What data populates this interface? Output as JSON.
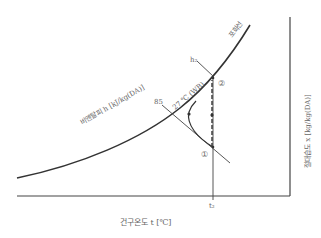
{
  "diagram": {
    "type": "psychrometric-chart",
    "labels": {
      "saturation_line": "포화선",
      "enthalpy_axis": "비엔탈피  h [kJ/kg(DA)]",
      "enthalpy_line_value": "85",
      "wet_bulb_label": "27 ℃ (WB)",
      "h2_label": "h₂",
      "point_1": "①",
      "point_2": "②",
      "x_axis": "건구온도  t [℃]",
      "y_axis": "절대습도  x [kg/kg(DA)]",
      "t2_tick": "t₂"
    },
    "colors": {
      "line": "#333333",
      "text": "#666666",
      "background": "#ffffff"
    }
  }
}
